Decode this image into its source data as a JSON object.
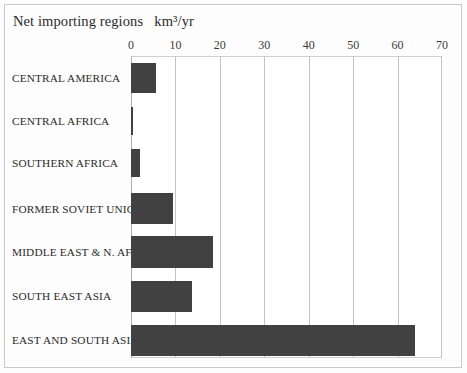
{
  "figure": {
    "title": "Net importing regions   km³/yr",
    "bar_color": "#414141",
    "gridline_color": "#c4c4c4",
    "frame_color": "#c9c9c9",
    "background_color": "#ffffff"
  },
  "chart_data": {
    "type": "bar",
    "orientation": "horizontal",
    "title": "Net importing regions   km³/yr",
    "xlabel": "km³/yr",
    "ylabel": "",
    "xlim": [
      0,
      70
    ],
    "xticks": [
      0,
      10,
      20,
      30,
      40,
      50,
      60,
      70
    ],
    "xtick_labels": [
      "0",
      "10",
      "20",
      "30",
      "40",
      "50",
      "60",
      "70"
    ],
    "grid": true,
    "legend": false,
    "categories": [
      "CENTRAL AMERICA",
      "CENTRAL AFRICA",
      "SOUTHERN AFRICA",
      "FORMER SOVIET UNION",
      "MIDDLE EAST & N. AFRICA",
      "SOUTH EAST ASIA",
      "EAST AND SOUTH ASIA"
    ],
    "values": [
      5.6,
      0.5,
      2.0,
      9.5,
      18.5,
      13.8,
      64.0
    ],
    "bar_color": "#414141"
  },
  "ticks": [
    {
      "label": "0",
      "value": 0
    },
    {
      "label": "10",
      "value": 10
    },
    {
      "label": "20",
      "value": 20
    },
    {
      "label": "30",
      "value": 30
    },
    {
      "label": "40",
      "value": 40
    },
    {
      "label": "50",
      "value": 50
    },
    {
      "label": "60",
      "value": 60
    },
    {
      "label": "70",
      "value": 70
    }
  ],
  "rows": [
    {
      "label": "CENTRAL AMERICA",
      "value": 5.6,
      "center_y": 78,
      "bar_top": 63,
      "bar_height": 30
    },
    {
      "label": "CENTRAL AFRICA",
      "value": 0.5,
      "center_y": 121,
      "bar_top": 107,
      "bar_height": 28
    },
    {
      "label": "SOUTHERN AFRICA",
      "value": 2.0,
      "center_y": 163,
      "bar_top": 149,
      "bar_height": 28
    },
    {
      "label": "FORMER SOVIET UNION",
      "value": 9.5,
      "center_y": 209,
      "bar_top": 193,
      "bar_height": 31
    },
    {
      "label": "MIDDLE EAST & N. AFRICA",
      "value": 18.5,
      "center_y": 252,
      "bar_top": 236,
      "bar_height": 32
    },
    {
      "label": "SOUTH EAST ASIA",
      "value": 13.8,
      "center_y": 296,
      "bar_top": 281,
      "bar_height": 31
    },
    {
      "label": "EAST AND SOUTH ASIA",
      "value": 64.0,
      "center_y": 340,
      "bar_top": 325,
      "bar_height": 31
    }
  ]
}
